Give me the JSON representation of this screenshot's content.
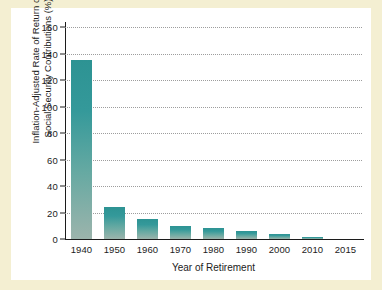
{
  "figure": {
    "frame_color": "#f4efd2",
    "card_color": "#ffffff"
  },
  "chart_data": {
    "type": "bar",
    "title": "",
    "xlabel": "Year of Retirement",
    "ylabel_line1": "Inflation-Adjusted Rate of Return on",
    "ylabel_line2": "Social Security Contributions (%)",
    "categories": [
      "1940",
      "1950",
      "1960",
      "1970",
      "1980",
      "1990",
      "2000",
      "2010",
      "2015"
    ],
    "values": [
      135,
      24,
      15,
      10,
      8,
      6,
      4,
      1.5,
      0.3
    ],
    "ylim": [
      0,
      160
    ],
    "ytick_labels": [
      "0",
      "20",
      "40",
      "60",
      "80",
      "100",
      "120",
      "140",
      "160"
    ],
    "ytick_values": [
      0,
      20,
      40,
      60,
      80,
      100,
      120,
      140,
      160
    ],
    "grid": "horizontal-dotted",
    "legend": "none",
    "bar_color_top": "#2d9393",
    "bar_color_bottom": "#9cb4ac",
    "axis_color": "#1c1c1c",
    "grid_color": "#8d8d8d"
  }
}
